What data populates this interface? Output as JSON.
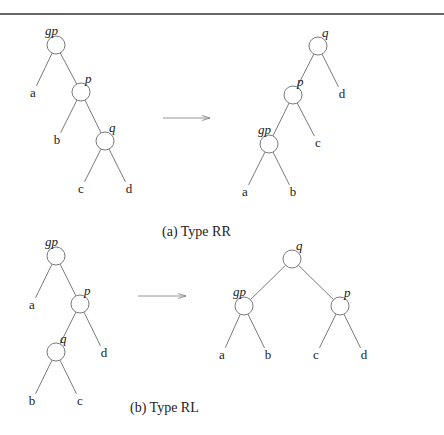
{
  "figure": {
    "type": "tree-rotation-diagram",
    "panels": [
      {
        "id": "a",
        "caption": "(a) Type RR",
        "before": {
          "nodes": [
            {
              "id": "gp",
              "label": "gp",
              "cx": 56,
              "cy": 45
            },
            {
              "id": "p",
              "label": "p",
              "cx": 81,
              "cy": 92
            },
            {
              "id": "q",
              "label": "q",
              "cx": 105,
              "cy": 141
            }
          ],
          "leaves": [
            {
              "id": "a",
              "label": "a",
              "x": 33,
              "y": 93
            },
            {
              "id": "b",
              "label": "b",
              "x": 57,
              "y": 140
            },
            {
              "id": "c",
              "label": "c",
              "x": 81,
              "y": 189
            },
            {
              "id": "d",
              "label": "d",
              "x": 129,
              "y": 189
            }
          ],
          "edges": [
            [
              "gp",
              "a"
            ],
            [
              "gp",
              "p"
            ],
            [
              "p",
              "b"
            ],
            [
              "p",
              "q"
            ],
            [
              "q",
              "c"
            ],
            [
              "q",
              "d"
            ]
          ]
        },
        "after": {
          "nodes": [
            {
              "id": "q",
              "label": "q",
              "cx": 318,
              "cy": 46
            },
            {
              "id": "p",
              "label": "p",
              "cx": 293,
              "cy": 95
            },
            {
              "id": "gp",
              "label": "gp",
              "cx": 269,
              "cy": 144
            }
          ],
          "leaves": [
            {
              "id": "d",
              "label": "d",
              "x": 342,
              "y": 94
            },
            {
              "id": "c",
              "label": "c",
              "x": 318,
              "y": 143
            },
            {
              "id": "a",
              "label": "a",
              "x": 245,
              "y": 192
            },
            {
              "id": "b",
              "label": "b",
              "x": 293,
              "y": 192
            }
          ],
          "edges": [
            [
              "q",
              "p"
            ],
            [
              "q",
              "d"
            ],
            [
              "p",
              "gp"
            ],
            [
              "p",
              "c"
            ],
            [
              "gp",
              "a"
            ],
            [
              "gp",
              "b"
            ]
          ]
        },
        "arrow": {
          "x1": 163,
          "y1": 118,
          "x2": 210,
          "y2": 118
        }
      },
      {
        "id": "b",
        "caption": "(b) Type RL",
        "before": {
          "nodes": [
            {
              "id": "gp",
              "label": "gp",
              "cx": 56,
              "cy": 256
            },
            {
              "id": "p",
              "label": "p",
              "cx": 80,
              "cy": 304
            },
            {
              "id": "q",
              "label": "q",
              "cx": 56,
              "cy": 352
            }
          ],
          "leaves": [
            {
              "id": "a",
              "label": "a",
              "x": 32,
              "y": 305
            },
            {
              "id": "d",
              "label": "d",
              "x": 104,
              "y": 353
            },
            {
              "id": "b",
              "label": "b",
              "x": 32,
              "y": 401
            },
            {
              "id": "c",
              "label": "c",
              "x": 80,
              "y": 401
            }
          ],
          "edges": [
            [
              "gp",
              "a"
            ],
            [
              "gp",
              "p"
            ],
            [
              "p",
              "q"
            ],
            [
              "p",
              "d"
            ],
            [
              "q",
              "b"
            ],
            [
              "q",
              "c"
            ]
          ]
        },
        "after": {
          "nodes": [
            {
              "id": "q",
              "label": "q",
              "cx": 292,
              "cy": 259
            },
            {
              "id": "gp",
              "label": "gp",
              "cx": 244,
              "cy": 306
            },
            {
              "id": "p",
              "label": "p",
              "cx": 340,
              "cy": 306
            }
          ],
          "leaves": [
            {
              "id": "a",
              "label": "a",
              "x": 222,
              "y": 355
            },
            {
              "id": "b",
              "label": "b",
              "x": 268,
              "y": 355
            },
            {
              "id": "c",
              "label": "c",
              "x": 316,
              "y": 355
            },
            {
              "id": "d",
              "label": "d",
              "x": 364,
              "y": 355
            }
          ],
          "edges": [
            [
              "q",
              "gp"
            ],
            [
              "q",
              "p"
            ],
            [
              "gp",
              "a"
            ],
            [
              "gp",
              "b"
            ],
            [
              "p",
              "c"
            ],
            [
              "p",
              "d"
            ]
          ]
        },
        "arrow": {
          "x1": 138,
          "y1": 296,
          "x2": 186,
          "y2": 296
        }
      }
    ]
  },
  "captions": {
    "a": "(a) Type RR",
    "b": "(b) Type RL"
  },
  "labels": {
    "gp": "gp",
    "p": "p",
    "q": "q",
    "a": "a",
    "b": "b",
    "c": "c",
    "d": "d"
  }
}
